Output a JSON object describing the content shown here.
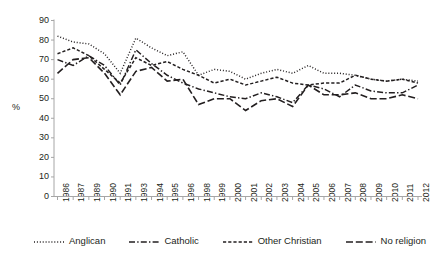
{
  "chart_data": {
    "type": "line",
    "title": "",
    "xlabel": "",
    "ylabel": "%",
    "ylim": [
      0,
      90
    ],
    "ytick_step": 10,
    "grid": false,
    "legend_position": "bottom",
    "categories": [
      "1986",
      "1987",
      "1989",
      "1990",
      "1991",
      "1993",
      "1994",
      "1995",
      "1996",
      "1998",
      "1999",
      "2000",
      "2001",
      "2002",
      "2003",
      "2004",
      "2005",
      "2006",
      "2007",
      "2008",
      "2009",
      "2010",
      "2011",
      "2012"
    ],
    "ytick_labels": [
      "90",
      "80",
      "70",
      "60",
      "50",
      "40",
      "30",
      "20",
      "10",
      "0"
    ],
    "series": [
      {
        "name": "Anglican",
        "style": "dotted",
        "values": [
          82,
          79,
          78,
          73,
          63,
          81,
          76,
          72,
          74,
          62,
          65,
          64,
          60,
          63,
          65,
          63,
          67,
          63,
          63,
          62,
          60,
          59,
          60,
          59
        ]
      },
      {
        "name": "Catholic",
        "style": "dash-dot",
        "values": [
          70,
          67,
          72,
          67,
          57,
          75,
          68,
          62,
          58,
          55,
          53,
          51,
          50,
          53,
          51,
          48,
          57,
          55,
          51,
          57,
          54,
          53,
          53,
          57
        ]
      },
      {
        "name": "Other Christian",
        "style": "short-dash",
        "values": [
          73,
          76,
          72,
          65,
          58,
          71,
          67,
          69,
          65,
          62,
          58,
          60,
          57,
          59,
          61,
          58,
          57,
          58,
          58,
          62,
          60,
          59,
          60,
          58
        ]
      },
      {
        "name": "No religion",
        "style": "long-dash",
        "values": [
          63,
          70,
          71,
          63,
          52,
          64,
          66,
          59,
          60,
          47,
          50,
          50,
          44,
          49,
          50,
          46,
          57,
          52,
          52,
          53,
          50,
          50,
          52,
          50
        ]
      }
    ]
  },
  "legend": {
    "items": [
      {
        "label": "Anglican",
        "style": "dotted"
      },
      {
        "label": "Catholic",
        "style": "dash-dot"
      },
      {
        "label": "Other Christian",
        "style": "short-dash"
      },
      {
        "label": "No religion",
        "style": "long-dash"
      }
    ]
  },
  "axis": {
    "y_title": "%"
  },
  "colors": {
    "line": "#231f20",
    "axis": "#a6a6a6",
    "text": "#231f20",
    "background": "#ffffff"
  }
}
